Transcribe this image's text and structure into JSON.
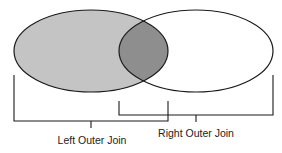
{
  "diagram": {
    "type": "venn",
    "colors": {
      "left_fill": "#c4c4c4",
      "intersection_fill": "#8e8e8e",
      "right_fill": "#ffffff",
      "stroke": "#1a1a1a"
    },
    "sets": [
      {
        "id": "left",
        "label": "Left table"
      },
      {
        "id": "right",
        "label": "Right table"
      }
    ],
    "brackets": [
      {
        "id": "left-outer-join",
        "label": "Left Outer Join",
        "covers": [
          "left",
          "intersection"
        ]
      },
      {
        "id": "right-outer-join",
        "label": "Right Outer Join",
        "covers": [
          "intersection",
          "right"
        ]
      }
    ]
  }
}
